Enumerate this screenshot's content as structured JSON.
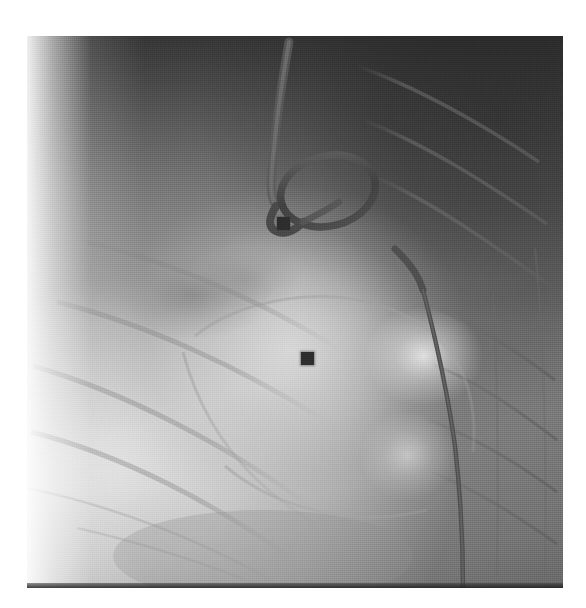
{
  "image": {
    "modality_label": "fluoroscopy",
    "view_label": "lateral chest",
    "frame": {
      "left": 27,
      "top": 36,
      "width": 536,
      "height": 552
    },
    "background_color": "#ffffff",
    "tone_range": {
      "darkest": "#343434",
      "midtone": "#8e8e8e",
      "brightest": "#f0f0f0"
    }
  },
  "regions": [
    {
      "name": "lung-field-dark",
      "label": "Dark lung field (upper right)",
      "tone": "#3c3c3c"
    },
    {
      "name": "soft-tissue-bright",
      "label": "Bright soft tissue / diaphragm (lower left)",
      "tone": "#e9e9e9"
    },
    {
      "name": "cardiac-silhouette",
      "label": "Cardiac silhouette",
      "tone": "#d2d2d2"
    },
    {
      "name": "vessel-shadow",
      "label": "Rounded vascular shadow",
      "tone": "#787878"
    },
    {
      "name": "contrast-blush",
      "label": "Contrast blush",
      "tone": "#f4f4f4"
    },
    {
      "name": "rib-shadows",
      "label": "Posterior rib shadows",
      "tone": "#6a6a6a"
    }
  ],
  "devices": [
    {
      "name": "pigtail-catheter",
      "label": "Pigtail catheter with looped tip",
      "tone": "#4a4a4a",
      "loop_center": {
        "x": 328,
        "y": 191
      },
      "loop_rx": 48,
      "loop_ry": 35
    },
    {
      "name": "catheter-shaft",
      "label": "Catheter shaft entering from superior",
      "tone": "#555555"
    },
    {
      "name": "guidewire-descending",
      "label": "Guidewire / catheter along descending aorta",
      "tone": "#4f4f4f"
    }
  ],
  "markers": [
    {
      "name": "marker-upper",
      "label": "Radiopaque square marker (upper)",
      "x": 283,
      "y": 223,
      "size_px": 13,
      "tone": "#2d2d2d"
    },
    {
      "name": "marker-lower",
      "label": "Radiopaque square marker (lower)",
      "x": 307,
      "y": 358,
      "size_px": 13,
      "tone": "#2d2d2d"
    }
  ],
  "annotations": {
    "corner_tick": {
      "name": "corner-tick-mark",
      "label": "Faint corner tick",
      "x": 36,
      "y": 42
    }
  },
  "overlay_text": []
}
